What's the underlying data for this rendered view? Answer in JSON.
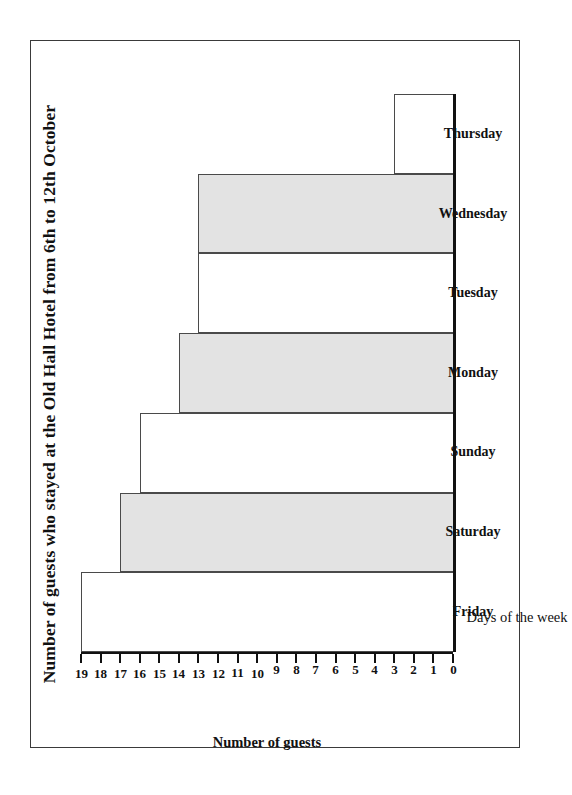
{
  "chart_data": {
    "type": "bar",
    "title": "Number of guests who stayed at the Old Hall Hotel from 6th to 12th October",
    "orientation": "rotated-vertical-bar",
    "categories": [
      "Friday",
      "Saturday",
      "Sunday",
      "Monday",
      "Tuesday",
      "Wednesday",
      "Thursday"
    ],
    "values": [
      19,
      17,
      16,
      14,
      13,
      13,
      3
    ],
    "xlabel": "Days of the week",
    "ylabel": "Number of guests",
    "ylim": [
      0,
      19
    ],
    "ytick_labels": [
      "0",
      "1",
      "2",
      "3",
      "4",
      "5",
      "6",
      "7",
      "8",
      "9",
      "10",
      "11",
      "12",
      "13",
      "14",
      "15",
      "16",
      "17",
      "18",
      "19"
    ],
    "grid": false,
    "legend": false,
    "bar_fills": [
      "plain",
      "shaded",
      "plain",
      "shaded",
      "plain",
      "shaded",
      "plain"
    ],
    "colors": {
      "bar_shaded": "#e3e3e3",
      "bar_plain": "#ffffff",
      "bar_outline": "#4a4a4a",
      "axis": "#111111",
      "page_border": "#3a3a3a",
      "background": "#ffffff"
    }
  }
}
